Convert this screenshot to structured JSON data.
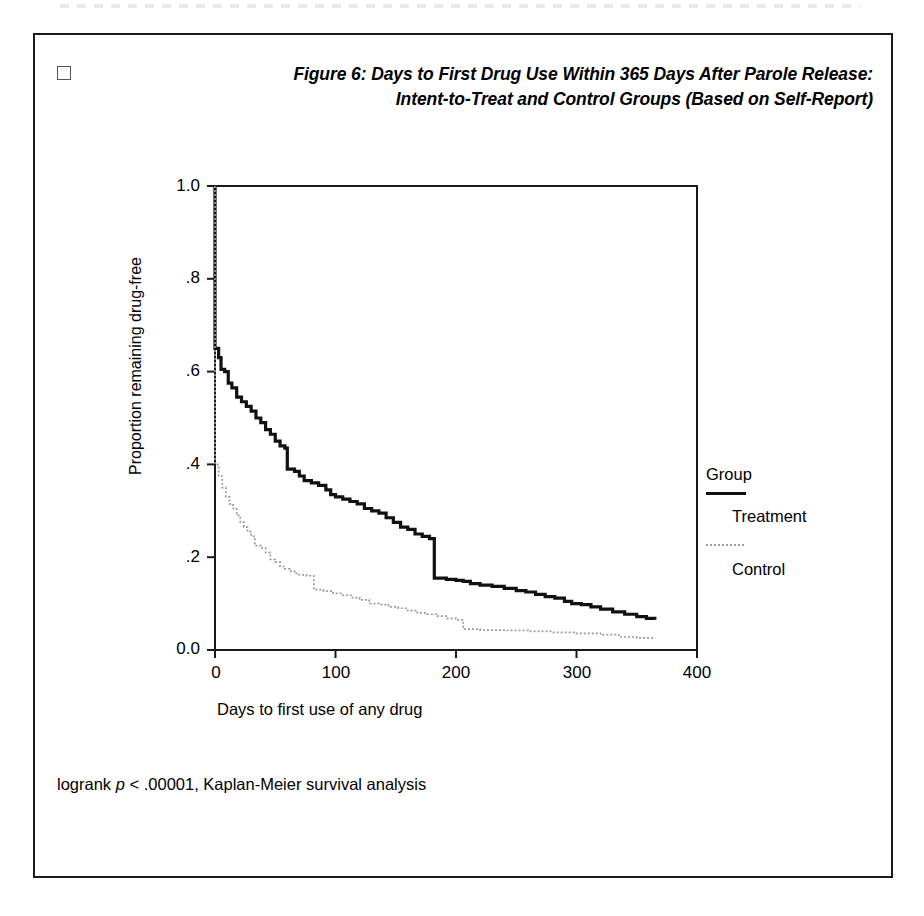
{
  "figure": {
    "checkbox_marker": "checkbox-empty",
    "title_line1": "Figure 6: Days to First Drug Use Within 365 Days After Parole Release:",
    "title_line2": "Intent-to-Treat and Control Groups (Based on Self-Report)",
    "footnote_prefix": "logrank ",
    "footnote_italic": "p",
    "footnote_suffix": " < .00001, Kaplan-Meier survival analysis"
  },
  "legend": {
    "title": "Group",
    "entries": [
      {
        "label": "Treatment",
        "style": "solid",
        "color": "#111111"
      },
      {
        "label": "Control",
        "style": "dotted",
        "color": "#9a9a9a"
      }
    ]
  },
  "chart_data": {
    "type": "line",
    "subtype": "kaplan-meier-survival-step",
    "title": "Figure 6: Days to First Drug Use Within 365 Days After Parole Release: Intent-to-Treat and Control Groups (Based on Self-Report)",
    "xlabel": "Days to first use of any drug",
    "ylabel": "Proportion remaining drug-free",
    "xlim": [
      0,
      400
    ],
    "ylim": [
      0.0,
      1.0
    ],
    "xticks": [
      0,
      100,
      200,
      300,
      400
    ],
    "xtick_labels": [
      "0",
      "100",
      "200",
      "300",
      "400"
    ],
    "yticks": [
      0.0,
      0.2,
      0.4,
      0.6,
      0.8,
      1.0
    ],
    "ytick_labels": [
      "0.0",
      ".2",
      ".4",
      ".6",
      ".8",
      "1.0"
    ],
    "grid": false,
    "legend_position": "right",
    "annotation": "logrank p < .00001, Kaplan-Meier survival analysis",
    "series": [
      {
        "name": "Treatment",
        "style": "solid",
        "color": "#111111",
        "points": [
          [
            0,
            1.0
          ],
          [
            0,
            0.65
          ],
          [
            3,
            0.63
          ],
          [
            5,
            0.605
          ],
          [
            8,
            0.6
          ],
          [
            11,
            0.575
          ],
          [
            14,
            0.565
          ],
          [
            18,
            0.545
          ],
          [
            22,
            0.535
          ],
          [
            26,
            0.525
          ],
          [
            30,
            0.515
          ],
          [
            34,
            0.5
          ],
          [
            38,
            0.49
          ],
          [
            42,
            0.475
          ],
          [
            46,
            0.465
          ],
          [
            50,
            0.45
          ],
          [
            54,
            0.44
          ],
          [
            58,
            0.435
          ],
          [
            60,
            0.39
          ],
          [
            66,
            0.385
          ],
          [
            70,
            0.375
          ],
          [
            74,
            0.365
          ],
          [
            80,
            0.36
          ],
          [
            86,
            0.355
          ],
          [
            92,
            0.345
          ],
          [
            96,
            0.335
          ],
          [
            100,
            0.33
          ],
          [
            106,
            0.325
          ],
          [
            112,
            0.32
          ],
          [
            118,
            0.315
          ],
          [
            124,
            0.305
          ],
          [
            130,
            0.3
          ],
          [
            136,
            0.295
          ],
          [
            142,
            0.285
          ],
          [
            148,
            0.275
          ],
          [
            154,
            0.265
          ],
          [
            160,
            0.26
          ],
          [
            166,
            0.25
          ],
          [
            172,
            0.245
          ],
          [
            178,
            0.24
          ],
          [
            182,
            0.155
          ],
          [
            192,
            0.152
          ],
          [
            200,
            0.15
          ],
          [
            206,
            0.148
          ],
          [
            212,
            0.143
          ],
          [
            220,
            0.14
          ],
          [
            230,
            0.137
          ],
          [
            240,
            0.133
          ],
          [
            250,
            0.128
          ],
          [
            258,
            0.125
          ],
          [
            266,
            0.12
          ],
          [
            274,
            0.115
          ],
          [
            282,
            0.112
          ],
          [
            290,
            0.105
          ],
          [
            296,
            0.1
          ],
          [
            304,
            0.098
          ],
          [
            312,
            0.093
          ],
          [
            320,
            0.088
          ],
          [
            330,
            0.082
          ],
          [
            340,
            0.077
          ],
          [
            350,
            0.072
          ],
          [
            358,
            0.068
          ],
          [
            365,
            0.065
          ]
        ]
      },
      {
        "name": "Control",
        "style": "dotted",
        "color": "#9a9a9a",
        "points": [
          [
            0,
            1.0
          ],
          [
            0,
            0.4
          ],
          [
            3,
            0.375
          ],
          [
            6,
            0.35
          ],
          [
            9,
            0.33
          ],
          [
            12,
            0.315
          ],
          [
            15,
            0.305
          ],
          [
            18,
            0.29
          ],
          [
            21,
            0.275
          ],
          [
            24,
            0.265
          ],
          [
            27,
            0.255
          ],
          [
            30,
            0.245
          ],
          [
            33,
            0.225
          ],
          [
            38,
            0.22
          ],
          [
            42,
            0.21
          ],
          [
            46,
            0.195
          ],
          [
            50,
            0.19
          ],
          [
            54,
            0.18
          ],
          [
            58,
            0.175
          ],
          [
            62,
            0.17
          ],
          [
            66,
            0.165
          ],
          [
            70,
            0.162
          ],
          [
            76,
            0.16
          ],
          [
            82,
            0.13
          ],
          [
            90,
            0.127
          ],
          [
            98,
            0.122
          ],
          [
            106,
            0.118
          ],
          [
            114,
            0.113
          ],
          [
            120,
            0.108
          ],
          [
            128,
            0.1
          ],
          [
            136,
            0.098
          ],
          [
            144,
            0.093
          ],
          [
            152,
            0.09
          ],
          [
            160,
            0.085
          ],
          [
            168,
            0.08
          ],
          [
            176,
            0.077
          ],
          [
            184,
            0.073
          ],
          [
            192,
            0.068
          ],
          [
            200,
            0.065
          ],
          [
            206,
            0.045
          ],
          [
            220,
            0.043
          ],
          [
            240,
            0.042
          ],
          [
            260,
            0.04
          ],
          [
            280,
            0.038
          ],
          [
            300,
            0.036
          ],
          [
            320,
            0.033
          ],
          [
            335,
            0.028
          ],
          [
            350,
            0.026
          ],
          [
            365,
            0.025
          ]
        ]
      }
    ]
  }
}
